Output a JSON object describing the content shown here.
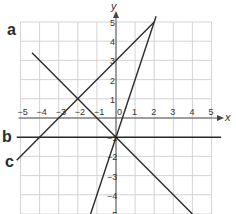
{
  "chart_data": {
    "type": "line",
    "title": "",
    "xlabel": "x",
    "ylabel": "y",
    "xlim": [
      -5,
      5
    ],
    "ylim": [
      -5,
      5
    ],
    "grid": true,
    "x_ticks": [
      "-5",
      "-4",
      "-3",
      "-2",
      "-1",
      "0",
      "1",
      "2",
      "3",
      "4",
      "5"
    ],
    "y_ticks": [
      "5",
      "4",
      "3",
      "2",
      "1",
      "-1",
      "-2",
      "-3",
      "-4",
      "-5"
    ],
    "series": [
      {
        "name": "a",
        "equation": "y = -x - 1",
        "points": [
          [
            -4.4,
            3.4
          ],
          [
            -2,
            1
          ],
          [
            0,
            -1
          ],
          [
            4,
            -5
          ]
        ]
      },
      {
        "name": "b",
        "equation": "y = -1",
        "points": [
          [
            -5.2,
            -1
          ],
          [
            0,
            -1
          ],
          [
            5.5,
            -1
          ]
        ]
      },
      {
        "name": "c",
        "equation": "y = x + 3",
        "points": [
          [
            -5.2,
            -2.2
          ],
          [
            -2,
            1
          ],
          [
            0,
            3
          ],
          [
            2,
            5
          ]
        ]
      },
      {
        "name": "",
        "equation": "y = 3x - 1",
        "points": [
          [
            -1.33,
            -5
          ],
          [
            0,
            -1
          ],
          [
            2,
            5
          ],
          [
            2.1,
            5.3
          ]
        ]
      }
    ],
    "annotations": [
      {
        "text": "a",
        "near": [
          -5.2,
          4.6
        ]
      },
      {
        "text": "b",
        "near": [
          -5.6,
          -1
        ]
      },
      {
        "text": "c",
        "near": [
          -5.6,
          -2.3
        ]
      }
    ]
  },
  "labels": {
    "a": "a",
    "b": "b",
    "c": "c",
    "x_axis": "x",
    "y_axis": "y"
  }
}
